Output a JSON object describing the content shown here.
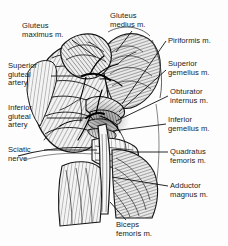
{
  "figure": {
    "style": "pen-and-ink crosshatch anatomical illustration",
    "ink_color": "#1b1b1b",
    "background_color": "#ffffff",
    "width": 228,
    "height": 246
  },
  "labels": [
    {
      "id": "gluteus-maximus",
      "lines": [
        "Gluteus",
        "maximus m."
      ],
      "text": "Gluteus maximus m.",
      "side": "top-left",
      "x": 22,
      "y": 22,
      "leader": {
        "x1": 72,
        "y1": 40,
        "x2": 96,
        "y2": 57
      }
    },
    {
      "id": "gluteus-medius",
      "lines": [
        "Gluteus",
        "medius m."
      ],
      "text": "Gluteus medius m.",
      "side": "top-right",
      "x": 110,
      "y": 12,
      "leader": {
        "x1": 132,
        "y1": 31,
        "x2": 116,
        "y2": 52
      }
    },
    {
      "id": "piriformis",
      "lines": [
        "Piriformis m."
      ],
      "text": "Piriformis m.",
      "side": "right",
      "x": 168,
      "y": 37,
      "leader": {
        "x1": 166,
        "y1": 41,
        "x2": 122,
        "y2": 104
      }
    },
    {
      "id": "superior-gluteal-artery",
      "lines": [
        "Superior",
        "gluteal",
        "artery"
      ],
      "text": "Superior gluteal artery",
      "side": "left",
      "x": 8,
      "y": 62,
      "leader": {
        "x1": 51,
        "y1": 76,
        "x2": 82,
        "y2": 76
      }
    },
    {
      "id": "superior-gemellus",
      "lines": [
        "Superior",
        "gemellus m."
      ],
      "text": "Superior gemellus m.",
      "side": "right",
      "x": 168,
      "y": 60,
      "leader": {
        "x1": 166,
        "y1": 70,
        "x2": 119,
        "y2": 112
      }
    },
    {
      "id": "obturator-internus",
      "lines": [
        "Obturator",
        "internus m."
      ],
      "text": "Obturator internus m.",
      "side": "right",
      "x": 170,
      "y": 88,
      "leader": {
        "x1": 168,
        "y1": 96,
        "x2": 116,
        "y2": 120
      }
    },
    {
      "id": "inferior-gluteal-artery",
      "lines": [
        "Inferior",
        "gluteal",
        "artery"
      ],
      "text": "Inferior gluteal artery",
      "side": "left",
      "x": 8,
      "y": 104,
      "leader": {
        "x1": 47,
        "y1": 118,
        "x2": 86,
        "y2": 118
      }
    },
    {
      "id": "inferior-gemellus",
      "lines": [
        "Inferior",
        "gemellus m."
      ],
      "text": "Inferior gemellus m.",
      "side": "right",
      "x": 168,
      "y": 116,
      "leader": {
        "x1": 166,
        "y1": 124,
        "x2": 113,
        "y2": 131
      }
    },
    {
      "id": "sciatic-nerve",
      "lines": [
        "Sciatic",
        "nerve"
      ],
      "text": "Sciatic nerve",
      "side": "left",
      "x": 8,
      "y": 146,
      "leader": {
        "x1": 44,
        "y1": 150,
        "x2": 96,
        "y2": 150
      }
    },
    {
      "id": "quadratus-femoris",
      "lines": [
        "Quadratus",
        "femoris m."
      ],
      "text": "Quadratus femoris m.",
      "side": "right",
      "x": 170,
      "y": 148,
      "leader": {
        "x1": 168,
        "y1": 152,
        "x2": 128,
        "y2": 152
      }
    },
    {
      "id": "adductor-magnus",
      "lines": [
        "Adductor",
        "magnus m."
      ],
      "text": "Adductor magnus m.",
      "side": "right",
      "x": 170,
      "y": 182,
      "leader": {
        "x1": 168,
        "y1": 186,
        "x2": 112,
        "y2": 177
      }
    },
    {
      "id": "biceps-femoris",
      "lines": [
        "Biceps",
        "femoris m."
      ],
      "text": "Biceps femoris m.",
      "side": "bottom",
      "x": 116,
      "y": 221,
      "leader": {
        "x1": 126,
        "y1": 220,
        "x2": 110,
        "y2": 203
      }
    }
  ],
  "structures": [
    {
      "name": "gluteus maximus muscle",
      "kind": "muscle"
    },
    {
      "name": "gluteus medius muscle",
      "kind": "muscle"
    },
    {
      "name": "piriformis muscle",
      "kind": "muscle"
    },
    {
      "name": "superior gemellus muscle",
      "kind": "muscle"
    },
    {
      "name": "obturator internus muscle",
      "kind": "muscle"
    },
    {
      "name": "inferior gemellus muscle",
      "kind": "muscle"
    },
    {
      "name": "quadratus femoris muscle",
      "kind": "muscle"
    },
    {
      "name": "adductor magnus muscle",
      "kind": "muscle"
    },
    {
      "name": "biceps femoris muscle",
      "kind": "muscle"
    },
    {
      "name": "superior gluteal artery",
      "kind": "artery"
    },
    {
      "name": "inferior gluteal artery",
      "kind": "artery"
    },
    {
      "name": "sciatic nerve",
      "kind": "nerve"
    }
  ]
}
